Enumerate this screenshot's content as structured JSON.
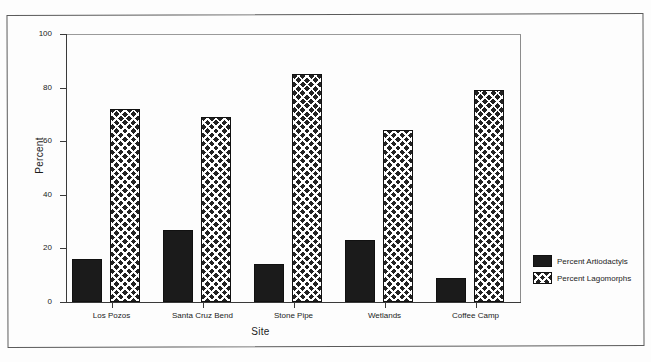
{
  "chart_data": {
    "type": "bar",
    "title": "",
    "xlabel": "Site",
    "ylabel": "Percent",
    "ylim": [
      0,
      100
    ],
    "yticks": [
      0,
      20,
      40,
      60,
      80,
      100
    ],
    "grid": false,
    "legend_position": "right",
    "categories": [
      "Los Pozos",
      "Santa Cruz Bend",
      "Stone Pipe",
      "Wetlands",
      "Coffee Camp"
    ],
    "series": [
      {
        "name": "Percent Artiodactyls",
        "fill": "solid-black",
        "values": [
          16,
          27,
          14,
          23,
          9
        ]
      },
      {
        "name": "Percent Lagomorphs",
        "fill": "crosshatch",
        "values": [
          72,
          69,
          85,
          64,
          79
        ]
      }
    ]
  },
  "legend": {
    "entries": [
      {
        "label": "Percent Artiodactyls",
        "swatch": "solid"
      },
      {
        "label": "Percent Lagomorphs",
        "swatch": "hatch"
      }
    ]
  },
  "colors": {
    "bar_dark": "#1b1b1b",
    "axis": "#3a3a3a",
    "frame": "#5b5b5b",
    "background": "#ffffff"
  }
}
